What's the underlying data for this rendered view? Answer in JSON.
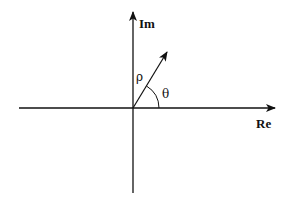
{
  "diagram": {
    "type": "complex-plane-polar",
    "axes": {
      "real": {
        "label": "Re"
      },
      "imaginary": {
        "label": "Im"
      }
    },
    "vector": {
      "magnitude_label": "ρ",
      "angle_label": "θ"
    },
    "colors": {
      "stroke": "#111111",
      "background": "#ffffff"
    }
  }
}
